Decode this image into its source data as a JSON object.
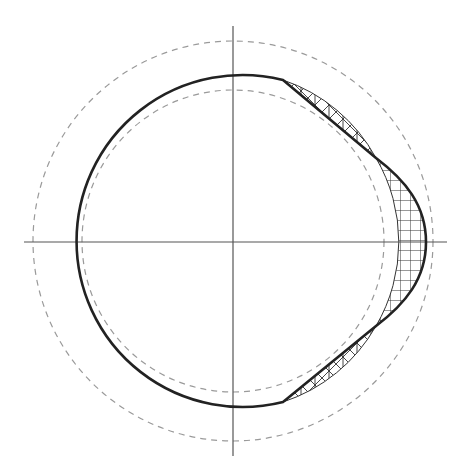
{
  "diagram": {
    "type": "cam-profile",
    "center": {
      "x": 233,
      "y": 241
    },
    "axes": {
      "horizontal": {
        "x1": 24,
        "x2": 447,
        "y": 242
      },
      "vertical": {
        "x": 233,
        "y1": 26,
        "y2": 456
      },
      "color": "#444444"
    },
    "circles": {
      "outer_dashed_radius": 200,
      "inner_dashed_radius": 151,
      "base_radius": 166,
      "dashed_color": "#999999"
    },
    "profile": {
      "stroke": "#222222",
      "upper_flat_start": {
        "x": 283,
        "y": 80
      },
      "upper_flat_end": {
        "x": 376,
        "y": 158
      },
      "peak": {
        "x": 426,
        "y": 242
      },
      "lower_flat_start": {
        "x": 376,
        "y": 326
      },
      "lower_flat_end": {
        "x": 283,
        "y": 402
      }
    },
    "hatched_regions": [
      {
        "name": "upper-undercut",
        "pattern": "cross-diagonal"
      },
      {
        "name": "right-lobe",
        "pattern": "grid"
      },
      {
        "name": "lower-undercut",
        "pattern": "cross-diagonal"
      }
    ]
  }
}
